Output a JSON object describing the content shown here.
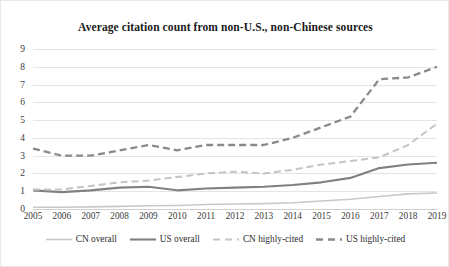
{
  "chart_data": {
    "type": "line",
    "title": "Average citation count from non-U.S., non-Chinese sources",
    "xlabel": "",
    "ylabel": "",
    "x": [
      2005,
      2006,
      2007,
      2008,
      2009,
      2010,
      2011,
      2012,
      2013,
      2014,
      2015,
      2016,
      2017,
      2018,
      2019
    ],
    "xtick_labels": [
      "2005",
      "2006",
      "2007",
      "2008",
      "2009",
      "2010",
      "2011",
      "2012",
      "2013",
      "2014",
      "2015",
      "2016",
      "2017",
      "2018",
      "2019"
    ],
    "ylim": [
      0,
      9
    ],
    "ytick_labels": [
      "0",
      "1",
      "2",
      "3",
      "4",
      "5",
      "6",
      "7",
      "8",
      "9"
    ],
    "yticks": [
      0,
      1,
      2,
      3,
      4,
      5,
      6,
      7,
      8,
      9
    ],
    "grid": "horizontal",
    "legend_position": "bottom",
    "series": [
      {
        "name": "CN overall",
        "color": "#c9c9c9",
        "style": "solid",
        "width": 1.6,
        "values": [
          0.1,
          0.1,
          0.12,
          0.15,
          0.18,
          0.2,
          0.25,
          0.28,
          0.3,
          0.35,
          0.45,
          0.55,
          0.7,
          0.85,
          0.9
        ]
      },
      {
        "name": "US overall",
        "color": "#808080",
        "style": "solid",
        "width": 2.1,
        "values": [
          1.05,
          0.95,
          1.05,
          1.2,
          1.25,
          1.05,
          1.15,
          1.2,
          1.25,
          1.35,
          1.5,
          1.75,
          2.3,
          2.5,
          2.6
        ]
      },
      {
        "name": "CN highly-cited",
        "color": "#c4c4c4",
        "style": "dashed",
        "width": 2.0,
        "values": [
          1.1,
          1.1,
          1.3,
          1.5,
          1.6,
          1.8,
          2.0,
          2.1,
          2.0,
          2.2,
          2.5,
          2.7,
          2.9,
          3.6,
          4.8
        ]
      },
      {
        "name": "US highly-cited",
        "color": "#8a8a8a",
        "style": "dashed",
        "width": 2.3,
        "values": [
          3.4,
          3.0,
          3.0,
          3.3,
          3.6,
          3.3,
          3.6,
          3.6,
          3.6,
          4.0,
          4.6,
          5.2,
          7.3,
          7.4,
          8.0
        ]
      }
    ]
  }
}
